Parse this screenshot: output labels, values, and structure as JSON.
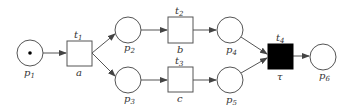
{
  "diagram": {
    "type": "petri-net",
    "places": [
      {
        "id": "p1",
        "label": "p",
        "sub": "1",
        "cx": 30,
        "cy": 53,
        "tokens": 1
      },
      {
        "id": "p2",
        "label": "p",
        "sub": "2",
        "cx": 128,
        "cy": 30,
        "tokens": 0
      },
      {
        "id": "p3",
        "label": "p",
        "sub": "3",
        "cx": 128,
        "cy": 80,
        "tokens": 0
      },
      {
        "id": "p4",
        "label": "p",
        "sub": "4",
        "cx": 230,
        "cy": 30,
        "tokens": 0
      },
      {
        "id": "p5",
        "label": "p",
        "sub": "5",
        "cx": 230,
        "cy": 80,
        "tokens": 0
      },
      {
        "id": "p6",
        "label": "p",
        "sub": "6",
        "cx": 323,
        "cy": 57,
        "tokens": 0
      }
    ],
    "transitions": [
      {
        "id": "t1",
        "label": "t",
        "sub": "1",
        "action": "a",
        "filled": false
      },
      {
        "id": "t2",
        "label": "t",
        "sub": "2",
        "action": "b",
        "filled": false
      },
      {
        "id": "t3",
        "label": "t",
        "sub": "3",
        "action": "c",
        "filled": false
      },
      {
        "id": "t4",
        "label": "t",
        "sub": "4",
        "action": "τ",
        "filled": true
      }
    ],
    "arcs": [
      [
        "p1",
        "t1"
      ],
      [
        "t1",
        "p2"
      ],
      [
        "t1",
        "p3"
      ],
      [
        "p2",
        "t2"
      ],
      [
        "p3",
        "t3"
      ],
      [
        "t2",
        "p4"
      ],
      [
        "t3",
        "p5"
      ],
      [
        "p4",
        "t4"
      ],
      [
        "p5",
        "t4"
      ],
      [
        "t4",
        "p6"
      ]
    ],
    "colors": {
      "stroke": "#555555",
      "fill_silent": "#000000",
      "token": "#000000",
      "background": "#ffffff"
    }
  }
}
